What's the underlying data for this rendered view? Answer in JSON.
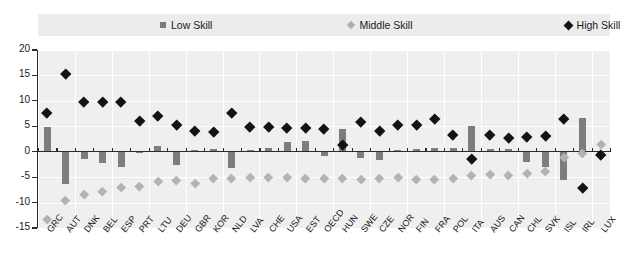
{
  "legend": {
    "position": "top",
    "items": [
      {
        "label": "Low Skill",
        "marker": "square-marker",
        "color": "#7a7a7a"
      },
      {
        "label": "Middle Skill",
        "marker": "diamond-small-marker",
        "color": "#b0b0b0"
      },
      {
        "label": "High Skill",
        "marker": "diamond-large-marker",
        "color": "#141414"
      }
    ]
  },
  "axis": {
    "y_ticks": [
      "20",
      "15",
      "10",
      "5",
      "0",
      "-5",
      "-10",
      "-15"
    ]
  },
  "chart_data": {
    "type": "bar",
    "title": "",
    "subtitle": "",
    "xlabel": "",
    "ylabel": "",
    "ylim": [
      -15,
      20
    ],
    "ytick_step": 5,
    "grid": true,
    "legend_position": "top",
    "categories": [
      "GRC",
      "AUT",
      "DNK",
      "BEL",
      "ESP",
      "PRT",
      "LTU",
      "DEU",
      "GBR",
      "KOR",
      "NLD",
      "LVA",
      "CHE",
      "USA",
      "EST",
      "OECD",
      "HUN",
      "SWE",
      "CZE",
      "NOR",
      "FIN",
      "FRA",
      "POL",
      "ITA",
      "AUS",
      "CAN",
      "CHL",
      "SVK",
      "ISL",
      "IRL",
      "LUX"
    ],
    "series": [
      {
        "name": "Low Skill",
        "type": "bar",
        "color": "#7d7d7d",
        "values": [
          4.9,
          -6.3,
          -1.5,
          -2.3,
          -3.1,
          -0.2,
          1.2,
          -2.7,
          0.3,
          0.6,
          -3.3,
          0.4,
          0.7,
          2.0,
          2.2,
          -0.9,
          4.5,
          -1.3,
          -1.6,
          0.3,
          0.6,
          0.7,
          0.8,
          5.0,
          0.5,
          0.6,
          -2.1,
          -3.1,
          -5.6,
          6.6,
          0.0
        ]
      },
      {
        "name": "Middle Skill",
        "type": "scatter",
        "color": "#b3b3b3",
        "values": [
          -13.3,
          -9.6,
          -8.3,
          -7.8,
          -7.0,
          -6.7,
          -5.9,
          -5.6,
          -6.2,
          -5.3,
          -5.2,
          -5.0,
          -5.1,
          -5.0,
          -5.3,
          -5.2,
          -5.3,
          -5.5,
          -5.2,
          -5.1,
          -5.4,
          -5.4,
          -5.2,
          -4.6,
          -4.5,
          -4.6,
          -4.3,
          -3.8,
          -1.0,
          -0.3,
          1.5
        ]
      },
      {
        "name": "High Skill",
        "type": "scatter",
        "color": "#131313",
        "values": [
          7.7,
          15.3,
          9.8,
          9.8,
          9.9,
          6.0,
          7.0,
          5.4,
          4.1,
          3.9,
          7.7,
          5.0,
          4.9,
          4.8,
          4.8,
          4.6,
          1.3,
          5.9,
          4.1,
          5.4,
          5.4,
          6.5,
          3.3,
          -1.4,
          3.4,
          2.8,
          3.0,
          3.1,
          6.5,
          -7.1,
          -0.6
        ]
      }
    ]
  }
}
